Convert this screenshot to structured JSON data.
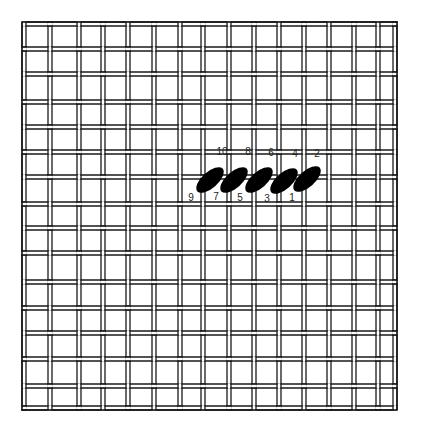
{
  "diagram": {
    "type": "needlepoint-stitch-diagram",
    "canvas": {
      "left": 22,
      "top": 22,
      "right": 397,
      "bottom": 410,
      "vertical_threads_x": [
        24,
        50,
        79,
        103,
        128,
        154,
        180,
        203,
        229,
        254,
        279,
        304,
        329,
        354,
        378,
        395
      ],
      "horizontal_threads_y": [
        24,
        49,
        74,
        102,
        127,
        152,
        177,
        204,
        228,
        253,
        282,
        308,
        333,
        359,
        386,
        408
      ],
      "thread_color": "#1a1a1a",
      "thread_width": 4
    },
    "stitches": [
      {
        "cx": 210,
        "cy": 180,
        "rx": 17,
        "ry": 8,
        "angle": -42
      },
      {
        "cx": 234,
        "cy": 180,
        "rx": 17,
        "ry": 8,
        "angle": -42
      },
      {
        "cx": 259,
        "cy": 180,
        "rx": 17,
        "ry": 8,
        "angle": -42
      },
      {
        "cx": 284,
        "cy": 181,
        "rx": 17,
        "ry": 8,
        "angle": -42
      },
      {
        "cx": 307,
        "cy": 179,
        "rx": 17,
        "ry": 8,
        "angle": -42
      }
    ],
    "stitch_color": "#000000",
    "labels_top": [
      {
        "text": "10",
        "x": 222,
        "y": 152
      },
      {
        "text": "8",
        "x": 248,
        "y": 152
      },
      {
        "text": "6",
        "x": 271,
        "y": 153
      },
      {
        "text": "4",
        "x": 295,
        "y": 154
      },
      {
        "text": "2",
        "x": 317,
        "y": 154
      }
    ],
    "labels_bottom": [
      {
        "text": "9",
        "x": 191,
        "y": 198
      },
      {
        "text": "7",
        "x": 216,
        "y": 197
      },
      {
        "text": "5",
        "x": 240,
        "y": 198
      },
      {
        "text": "3",
        "x": 267,
        "y": 199
      },
      {
        "text": "1",
        "x": 292,
        "y": 198
      }
    ]
  }
}
